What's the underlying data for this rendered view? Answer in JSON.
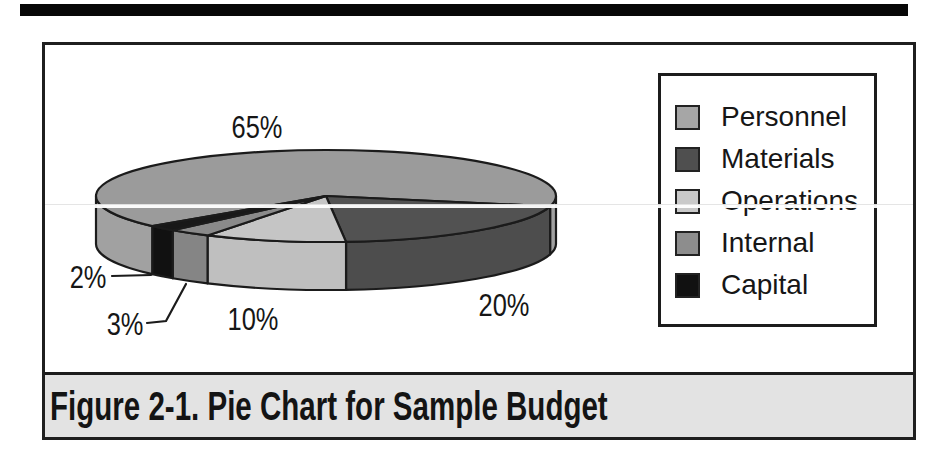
{
  "figure": {
    "caption": "Figure 2-1. Pie Chart for Sample Budget"
  },
  "colors": {
    "page_background": "#ffffff",
    "figure_border": "#1f1f1f",
    "caption_background": "#e3e3e3",
    "outline": "#1b1b1b",
    "top_rule": "#070707"
  },
  "chart_data": {
    "type": "pie",
    "style": "3d",
    "categories": [
      "Personnel",
      "Materials",
      "Operations",
      "Internal",
      "Capital"
    ],
    "values": [
      65,
      20,
      10,
      3,
      2
    ],
    "labels": [
      "65%",
      "20%",
      "10%",
      "3%",
      "2%"
    ],
    "legend_position": "right",
    "slices": [
      {
        "label": "Personnel",
        "value": 65,
        "pct_label": "65%",
        "top_color": "#9b9b9b",
        "side_color": "#a1a1a1",
        "legend_color": "#a6a6a6"
      },
      {
        "label": "Materials",
        "value": 20,
        "pct_label": "20%",
        "top_color": "#525252",
        "side_color": "#4d4d4d",
        "legend_color": "#4f4f4f"
      },
      {
        "label": "Operations",
        "value": 10,
        "pct_label": "10%",
        "top_color": "#c5c5c5",
        "side_color": "#bfbfbf",
        "legend_color": "#c9c9c9"
      },
      {
        "label": "Internal",
        "value": 3,
        "pct_label": "3%",
        "top_color": "#8a8a8a",
        "side_color": "#858585",
        "legend_color": "#8d8d8d"
      },
      {
        "label": "Capital",
        "value": 2,
        "pct_label": "2%",
        "top_color": "#181818",
        "side_color": "#111111",
        "legend_color": "#111111"
      }
    ],
    "geometry": {
      "cx": 326,
      "cy": 196,
      "rx": 230,
      "ry": 46,
      "depth": 48,
      "start_angle_deg": 139,
      "clockwise": true
    }
  }
}
